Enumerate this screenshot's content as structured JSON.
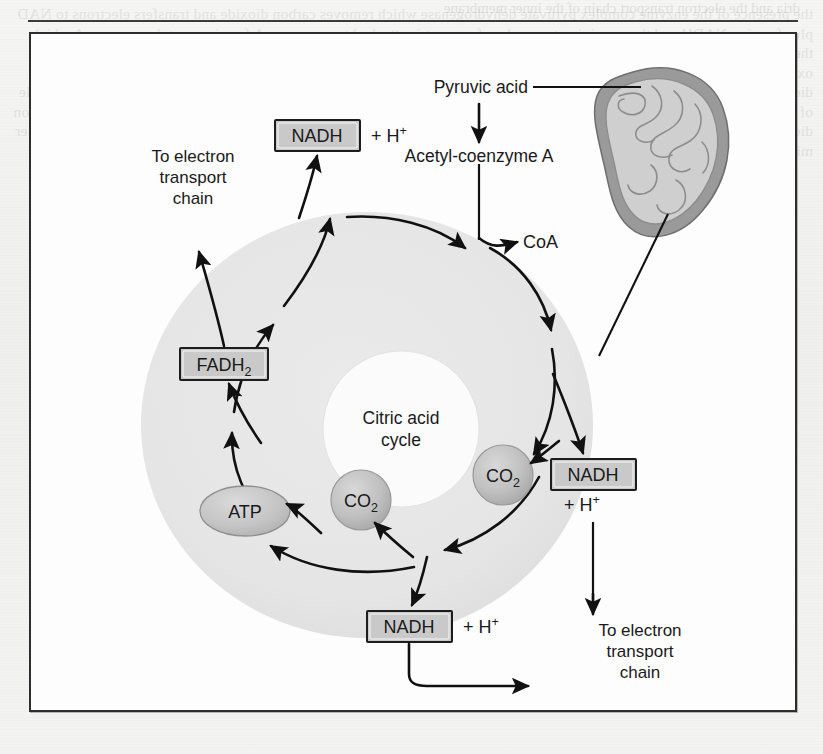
{
  "figure": {
    "center_label_line1": "Citric acid",
    "center_label_line2": "cycle",
    "inputs": {
      "pyruvic_acid": "Pyruvic acid",
      "acetyl_coenzyme_a": "Acetyl-coenzyme A"
    },
    "outputs": {
      "coa": "CoA",
      "atp": "ATP",
      "co2": "CO",
      "co2_sub": "2"
    },
    "carriers": [
      {
        "id": "nadh-top",
        "label": "NADH",
        "plus": "+ H",
        "sup": "+"
      },
      {
        "id": "nadh-right",
        "label": "NADH",
        "plus": "+ H",
        "sup": "+"
      },
      {
        "id": "nadh-bottom",
        "label": "NADH",
        "plus": "+ H",
        "sup": "+"
      },
      {
        "id": "fadh2",
        "label": "FADH",
        "sub": "2"
      }
    ],
    "destinations": {
      "left": {
        "line1": "To electron",
        "line2": "transport",
        "line3": "chain"
      },
      "right": {
        "line1": "To electron",
        "line2": "transport",
        "line3": "chain"
      }
    },
    "organelle": {
      "name": "mitochondrion"
    },
    "colors": {
      "matrix_fill": "#e6e6e6",
      "inner_fill": "#fdfdfd",
      "box_fill": "#c9c9c9",
      "bubble_fill": "#bfbfbf",
      "stroke": "#111111",
      "frame": "#2d2d2d",
      "membrane_outer": "#8f8f8f",
      "membrane_inner": "#cfcfcf"
    }
  },
  "bleed_text": "the presence of the enzyme complex pyruvate dehydrogenase which removes carbon dioxide and transfers electrons to NAD plus forming NADH and the remaining two carbon fragment is attached to coenzyme A forming acetyl coenzyme A which then enters the citric acid cycle also known as the Krebs cycle or the tricarboxylic acid cycle where it condenses with oxaloacetate to form citrate and through a series of eight enzymatic reactions the two carbon atoms are released as carbon dioxide while energy is captured in three NADH one FADH two and one ATP per turn of the cycle so that for each molecule of glucose two turns of the citric acid cycle occur yielding six NADH two FADH two and two ATP together with four carbon dioxide molecules and the reduced coenzymes then deliver their electrons to the electron transport chain located on the inner mitochondrial membrane where oxidative phosphorylation generates the bulk of the cell supply of adenosine triphosphate",
  "top_bleed_text": "dria and the electron transport chain of the inner membrane"
}
